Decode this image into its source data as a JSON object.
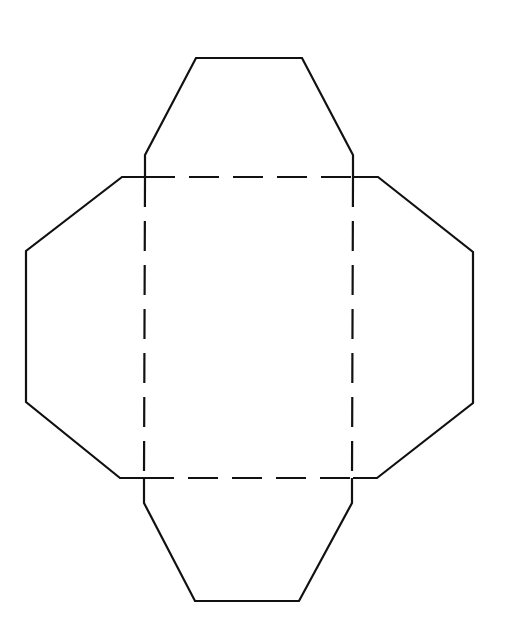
{
  "diagram": {
    "type": "envelope-template-net",
    "colors": {
      "background": "#ffffff",
      "line": "#111111"
    },
    "line_styles": {
      "cut": "solid",
      "fold": "dashed"
    },
    "center_square": {
      "x1": 145,
      "y1": 177,
      "x2": 353,
      "y2": 478
    },
    "flaps": [
      {
        "name": "top",
        "points": [
          [
            145,
            177
          ],
          [
            145,
            155
          ],
          [
            196,
            58
          ],
          [
            302,
            58
          ],
          [
            353,
            155
          ],
          [
            353,
            177
          ]
        ]
      },
      {
        "name": "left",
        "points": [
          [
            145,
            177
          ],
          [
            122,
            177
          ],
          [
            26,
            251
          ],
          [
            26,
            402
          ],
          [
            120,
            478
          ],
          [
            145,
            478
          ]
        ]
      },
      {
        "name": "right",
        "points": [
          [
            353,
            177
          ],
          [
            378,
            177
          ],
          [
            473,
            252
          ],
          [
            473,
            403
          ],
          [
            377,
            478
          ],
          [
            353,
            478
          ]
        ]
      },
      {
        "name": "bottom",
        "points": [
          [
            144,
            478
          ],
          [
            144,
            503
          ],
          [
            195,
            601
          ],
          [
            299,
            601
          ],
          [
            352,
            503
          ],
          [
            352,
            478
          ]
        ]
      }
    ],
    "fold_lines": [
      {
        "name": "top-fold",
        "x1": 145,
        "y1": 177,
        "x2": 353,
        "y2": 177
      },
      {
        "name": "bottom-fold",
        "x1": 144,
        "y1": 478,
        "x2": 352,
        "y2": 478
      },
      {
        "name": "left-fold",
        "x1": 145,
        "y1": 177,
        "x2": 144,
        "y2": 478
      },
      {
        "name": "right-fold",
        "x1": 353,
        "y1": 177,
        "x2": 352,
        "y2": 478
      }
    ]
  }
}
